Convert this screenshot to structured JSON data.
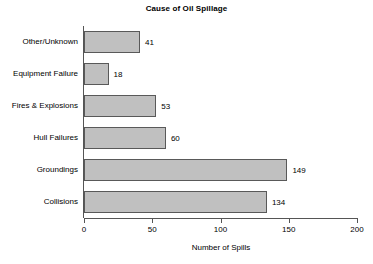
{
  "chart_data": {
    "type": "bar",
    "orientation": "horizontal",
    "title": "Cause of Oil Spillage",
    "xlabel": "Number of Spills",
    "ylabel": "",
    "categories": [
      "Other/Unknown",
      "Equipment Failure",
      "Fires & Explosions",
      "Hull Failures",
      "Groundings",
      "Collisions"
    ],
    "values": [
      41,
      18,
      53,
      60,
      149,
      134
    ],
    "value_labels": [
      "41",
      "18",
      "53",
      "60",
      "149",
      "134"
    ],
    "xlim": [
      0,
      200
    ],
    "xticks": [
      0,
      50,
      100,
      150,
      200
    ],
    "xtick_labels": [
      "0",
      "50",
      "100",
      "150",
      "200"
    ],
    "grid": false,
    "legend": false,
    "bar_fill_color": "#c0c0c0",
    "bar_border_color": "#595959",
    "axis_color": "#555555",
    "background_color": "#ffffff",
    "text_color": "#000000"
  }
}
